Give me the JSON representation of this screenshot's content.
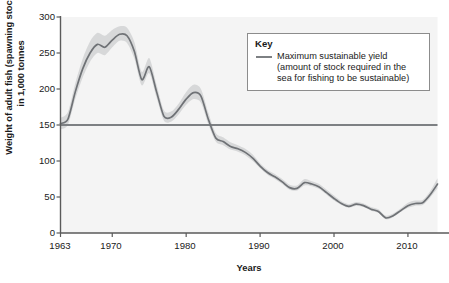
{
  "chart_data": {
    "type": "line",
    "title": "",
    "xlabel": "Years",
    "ylabel": "Weight of adult fish (spawning stock) in 1,000 tonnes",
    "ylabel_line1": "Weight of adult fish (spawning stock)",
    "ylabel_line2": "in 1,000 tonnes",
    "xlim": [
      1963,
      2014
    ],
    "ylim": [
      0,
      300
    ],
    "yticks": [
      0,
      50,
      100,
      150,
      200,
      250,
      300
    ],
    "ytick_labels": [
      "0",
      "50",
      "100",
      "150",
      "200",
      "250",
      "300"
    ],
    "xticks": [
      1963,
      1970,
      1980,
      1990,
      2000,
      2010
    ],
    "xtick_labels": [
      "1963",
      "1970",
      "1980",
      "1990",
      "2000",
      "2010"
    ],
    "grid": false,
    "legend_position": "top-right",
    "reference_line": {
      "name": "Maximum sustainable yield",
      "value": 150,
      "orientation": "horizontal",
      "color": "#7d8083"
    },
    "series": [
      {
        "name": "Weight of adult fish (spawning stock)",
        "color": "#6f7276",
        "band_color": "#d7d8d9",
        "x": [
          1963,
          1964,
          1965,
          1966,
          1967,
          1968,
          1969,
          1970,
          1971,
          1972,
          1973,
          1974,
          1975,
          1976,
          1977,
          1978,
          1979,
          1980,
          1981,
          1982,
          1983,
          1984,
          1985,
          1986,
          1987,
          1988,
          1989,
          1990,
          1991,
          1992,
          1993,
          1994,
          1995,
          1996,
          1997,
          1998,
          1999,
          2000,
          2001,
          2002,
          2003,
          2004,
          2005,
          2006,
          2007,
          2008,
          2009,
          2010,
          2011,
          2012,
          2013,
          2014
        ],
        "values": [
          152,
          158,
          196,
          228,
          250,
          262,
          258,
          268,
          276,
          274,
          252,
          213,
          231,
          196,
          162,
          161,
          172,
          186,
          195,
          190,
          158,
          132,
          127,
          120,
          117,
          112,
          104,
          93,
          84,
          78,
          71,
          63,
          62,
          70,
          68,
          64,
          56,
          48,
          41,
          37,
          40,
          38,
          33,
          30,
          21,
          24,
          31,
          38,
          41,
          42,
          53,
          68
        ],
        "band_lower": [
          144,
          150,
          186,
          216,
          238,
          250,
          247,
          258,
          267,
          264,
          242,
          205,
          222,
          188,
          156,
          155,
          165,
          178,
          186,
          181,
          151,
          127,
          122,
          116,
          113,
          108,
          100,
          90,
          81,
          75,
          68,
          60,
          59,
          66,
          65,
          61,
          53,
          45,
          39,
          35,
          38,
          36,
          31,
          28,
          19,
          22,
          29,
          35,
          38,
          39,
          49,
          62
        ],
        "band_upper": [
          160,
          168,
          208,
          242,
          266,
          278,
          274,
          282,
          287,
          285,
          265,
          224,
          243,
          206,
          170,
          169,
          180,
          196,
          206,
          200,
          167,
          139,
          133,
          126,
          122,
          117,
          109,
          97,
          88,
          82,
          75,
          67,
          66,
          75,
          72,
          68,
          60,
          52,
          44,
          40,
          43,
          41,
          36,
          33,
          24,
          27,
          34,
          42,
          45,
          46,
          58,
          76
        ]
      }
    ]
  },
  "legend": {
    "title": "Key",
    "entries": [
      {
        "label_line1": "Maximum sustainable yield",
        "label_line2": "(amount of stock required in the",
        "label_line3": "sea for fishing to be sustainable)",
        "swatch": "line-swatch"
      }
    ]
  },
  "colors": {
    "line": "#6f7276",
    "band": "#d7d8d9",
    "reference_line": "#7d8083",
    "axis": "#5a5a5a",
    "plot_background": "#f4f4f4",
    "legend_border": "#8c8c8c"
  }
}
